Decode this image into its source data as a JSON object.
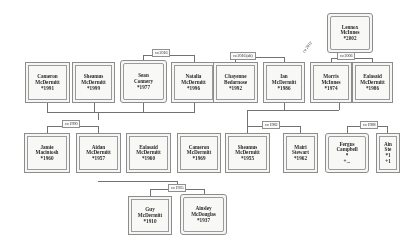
{
  "diagram": {
    "type": "family-tree",
    "line_color": "#6e6e6e",
    "box_border_color": "#8a8a8a",
    "box_fill_color": "#fbfbfa",
    "text_color": "#1c1c1c",
    "background_color": "#ffffff"
  },
  "people": [
    {
      "id": "cameron1991",
      "name_line1": "Cameron",
      "name_line2": "McDermitt",
      "birth": "*1991",
      "x": 25,
      "y": 62,
      "w": 45,
      "h": 41,
      "shape": "square"
    },
    {
      "id": "sheamus1999",
      "name_line1": "Sheamus",
      "name_line2": "McDermitt",
      "birth": "*1999",
      "x": 72,
      "y": 62,
      "w": 43,
      "h": 41,
      "shape": "square"
    },
    {
      "id": "seanconnery",
      "name_line1": "Sean",
      "name_line2": "Connery",
      "birth": "*1977",
      "x": 120,
      "y": 60,
      "w": 47,
      "h": 43,
      "shape": "rounded"
    },
    {
      "id": "natalia1996",
      "name_line1": "Natalia",
      "name_line2": "McDermitt",
      "birth": "*1996",
      "x": 171,
      "y": 62,
      "w": 45,
      "h": 41,
      "shape": "square"
    },
    {
      "id": "chayenne1992",
      "name_line1": "Chayenne",
      "name_line2": "Bedarnose",
      "birth": "*1992",
      "x": 213,
      "y": 62,
      "w": 45,
      "h": 41,
      "shape": "square"
    },
    {
      "id": "ian1986",
      "name_line1": "Ian",
      "name_line2": "McDermitt",
      "birth": "*1986",
      "x": 263,
      "y": 62,
      "w": 42,
      "h": 41,
      "shape": "square"
    },
    {
      "id": "morris1974",
      "name_line1": "Morris",
      "name_line2": "McInnes",
      "birth": "*1974",
      "x": 310,
      "y": 62,
      "w": 42,
      "h": 41,
      "shape": "square"
    },
    {
      "id": "ealasaid1986",
      "name_line1": "Ealasaid",
      "name_line2": "McDermitt",
      "birth": "*1986",
      "x": 352,
      "y": 62,
      "w": 41,
      "h": 41,
      "shape": "square"
    },
    {
      "id": "lennox2002",
      "name_line1": "Lennox",
      "name_line2": "McInnes",
      "birth": "*2002",
      "x": 327,
      "y": 13,
      "w": 46,
      "h": 40,
      "shape": "rounded"
    },
    {
      "id": "jamie1960",
      "name_line1": "Jamie",
      "name_line2": "Macintosh",
      "birth": "*1960",
      "x": 24,
      "y": 133,
      "w": 46,
      "h": 40,
      "shape": "square"
    },
    {
      "id": "aidan1957",
      "name_line1": "Aidan",
      "name_line2": "McDermitt",
      "birth": "*1957",
      "x": 76,
      "y": 133,
      "w": 45,
      "h": 40,
      "shape": "square"
    },
    {
      "id": "ealasaid1960",
      "name_line1": "Ealasaid",
      "name_line2": "McDermitt",
      "birth": "*1960",
      "x": 126,
      "y": 133,
      "w": 45,
      "h": 40,
      "shape": "square"
    },
    {
      "id": "cameron1969",
      "name_line1": "Cameron",
      "name_line2": "McDermitt",
      "birth": "*1969",
      "x": 177,
      "y": 133,
      "w": 44,
      "h": 40,
      "shape": "square"
    },
    {
      "id": "sheamus1955",
      "name_line1": "Sheamus",
      "name_line2": "McDermitt",
      "birth": "*1955",
      "x": 225,
      "y": 133,
      "w": 45,
      "h": 40,
      "shape": "square"
    },
    {
      "id": "mairi1962",
      "name_line1": "Mairi",
      "name_line2": "Stewart",
      "birth": "*1962",
      "x": 283,
      "y": 133,
      "w": 35,
      "h": 40,
      "shape": "square"
    },
    {
      "id": "ferguscamp",
      "name_line1": "Fergus",
      "name_line2": "Campbell",
      "birth": "*",
      "birth2": "+...",
      "x": 325,
      "y": 133,
      "w": 44,
      "h": 40,
      "shape": "rounded"
    },
    {
      "id": "ainsley_edge",
      "name_line1": "Ain",
      "name_line2": "Ste",
      "birth": "*1",
      "birth2": "+1",
      "x": 376,
      "y": 133,
      "w": 24,
      "h": 40,
      "shape": "square"
    },
    {
      "id": "guy1910",
      "name_line1": "Guy",
      "name_line2": "McDermitt",
      "birth": "*1910",
      "x": 128,
      "y": 196,
      "w": 44,
      "h": 39,
      "shape": "square"
    },
    {
      "id": "ainsley1937",
      "name_line1": "Ainsley",
      "name_line2": "McDouglas",
      "birth": "*1937",
      "x": 180,
      "y": 194,
      "w": 47,
      "h": 41,
      "shape": "rounded"
    }
  ],
  "marriage_labels": [
    {
      "id": "m2016",
      "text": "co 2016",
      "x": 152,
      "y": 49,
      "rotated": false
    },
    {
      "id": "m2016alt",
      "text": "co 2016 (alt)",
      "x": 230,
      "y": 52,
      "rotated": false
    },
    {
      "id": "m2006",
      "text": "co 2006",
      "x": 337,
      "y": 52,
      "rotated": false
    },
    {
      "id": "m_rot",
      "text": "co 2012",
      "x": 300,
      "y": 52,
      "rotated": true
    },
    {
      "id": "m1990",
      "text": "co 1990",
      "x": 62,
      "y": 120,
      "rotated": false
    },
    {
      "id": "m1982",
      "text": "co 1982",
      "x": 262,
      "y": 121,
      "rotated": false
    },
    {
      "id": "m1988",
      "text": "co 1988",
      "x": 360,
      "y": 121,
      "rotated": false
    },
    {
      "id": "m1935",
      "text": "co 1935",
      "x": 168,
      "y": 184,
      "rotated": false
    }
  ],
  "connectors": [
    {
      "id": "c1",
      "o": "h",
      "x": 143,
      "y": 55,
      "len": 52
    },
    {
      "id": "c2",
      "o": "v",
      "x": 143,
      "y": 55,
      "len": 7
    },
    {
      "id": "c3",
      "o": "v",
      "x": 194,
      "y": 55,
      "len": 7
    },
    {
      "id": "c4",
      "o": "h",
      "x": 235,
      "y": 57,
      "len": 49
    },
    {
      "id": "c5",
      "o": "v",
      "x": 235,
      "y": 57,
      "len": 5
    },
    {
      "id": "c6",
      "o": "v",
      "x": 284,
      "y": 57,
      "len": 5
    },
    {
      "id": "c7",
      "o": "h",
      "x": 331,
      "y": 58,
      "len": 41
    },
    {
      "id": "c8",
      "o": "v",
      "x": 331,
      "y": 58,
      "len": 4
    },
    {
      "id": "c9",
      "o": "v",
      "x": 372,
      "y": 58,
      "len": 4
    },
    {
      "id": "c10",
      "o": "v",
      "x": 350,
      "y": 53,
      "len": 5
    },
    {
      "id": "c11",
      "o": "h",
      "x": 47,
      "y": 112,
      "len": 148
    },
    {
      "id": "c12",
      "o": "v",
      "x": 47,
      "y": 103,
      "len": 9
    },
    {
      "id": "c13",
      "o": "v",
      "x": 94,
      "y": 103,
      "len": 9
    },
    {
      "id": "c14",
      "o": "v",
      "x": 143,
      "y": 103,
      "len": 9
    },
    {
      "id": "c15",
      "o": "v",
      "x": 194,
      "y": 103,
      "len": 9
    },
    {
      "id": "c16",
      "o": "v",
      "x": 98,
      "y": 112,
      "len": 8
    },
    {
      "id": "c17",
      "o": "h",
      "x": 47,
      "y": 126,
      "len": 52
    },
    {
      "id": "c18",
      "o": "v",
      "x": 47,
      "y": 126,
      "len": 7
    },
    {
      "id": "c19",
      "o": "v",
      "x": 98,
      "y": 126,
      "len": 7
    },
    {
      "id": "c20",
      "o": "h",
      "x": 247,
      "y": 126,
      "len": 53
    },
    {
      "id": "c21",
      "o": "v",
      "x": 247,
      "y": 126,
      "len": 7
    },
    {
      "id": "c22",
      "o": "v",
      "x": 300,
      "y": 126,
      "len": 7
    },
    {
      "id": "c23",
      "o": "h",
      "x": 247,
      "y": 110,
      "len": 92
    },
    {
      "id": "c24",
      "o": "v",
      "x": 284,
      "y": 103,
      "len": 7
    },
    {
      "id": "c25",
      "o": "v",
      "x": 339,
      "y": 103,
      "len": 7
    },
    {
      "id": "c26",
      "o": "v",
      "x": 247,
      "y": 110,
      "len": 16
    },
    {
      "id": "c27",
      "o": "h",
      "x": 347,
      "y": 126,
      "len": 40
    },
    {
      "id": "c28",
      "o": "v",
      "x": 347,
      "y": 126,
      "len": 7
    },
    {
      "id": "c29",
      "o": "v",
      "x": 387,
      "y": 126,
      "len": 7
    },
    {
      "id": "c30",
      "o": "h",
      "x": 150,
      "y": 189,
      "len": 54
    },
    {
      "id": "c31",
      "o": "v",
      "x": 150,
      "y": 189,
      "len": 7
    },
    {
      "id": "c32",
      "o": "v",
      "x": 204,
      "y": 189,
      "len": 5
    },
    {
      "id": "c33",
      "o": "v",
      "x": 177,
      "y": 181,
      "len": 8
    },
    {
      "id": "c34",
      "o": "h",
      "x": 98,
      "y": 181,
      "len": 79
    }
  ]
}
